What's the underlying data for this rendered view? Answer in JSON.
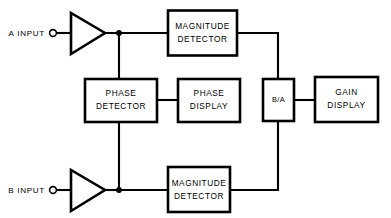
{
  "diagram": {
    "background_color": "#ffffff",
    "line_color": "#000000",
    "blocks": [
      {
        "id": "magnitude_detector_a",
        "label_line1": "MAGNITUDE",
        "label_line2": "DETECTOR"
      },
      {
        "id": "phase_detector",
        "label_line1": "PHASE",
        "label_line2": "DETECTOR"
      },
      {
        "id": "phase_display",
        "label_line1": "PHASE",
        "label_line2": "DISPLAY"
      },
      {
        "id": "ratio_block",
        "label_line1": "B/A",
        "label_line2": ""
      },
      {
        "id": "gain_display",
        "label_line1": "GAIN",
        "label_line2": "DISPLAY"
      },
      {
        "id": "magnitude_detector_b",
        "label_line1": "MAGNITUDE",
        "label_line2": "DETECTOR"
      }
    ],
    "inputs": [
      {
        "id": "input_a",
        "label": "A INPUT"
      },
      {
        "id": "input_b",
        "label": "B INPUT"
      }
    ],
    "amplifiers": [
      {
        "id": "amplifier_a",
        "symbol": "triangle-amplifier"
      },
      {
        "id": "amplifier_b",
        "symbol": "triangle-amplifier"
      }
    ]
  }
}
